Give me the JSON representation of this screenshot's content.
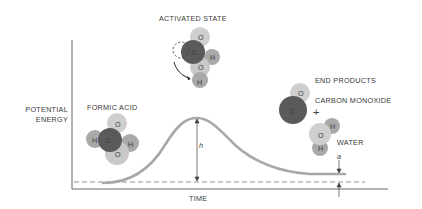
{
  "labels": {
    "activated_state": "ACTIVATED STATE",
    "end_products": "END PRODUCTS",
    "carbon_monoxide": "CARBON MONOXIDE",
    "plus": "+",
    "water": "WATER",
    "formic_acid": "FORMIC ACID",
    "y_axis_line1": "POTENTIAL",
    "y_axis_line2": "ENERGY",
    "x_axis": "TIME",
    "activation_height": "h",
    "energy_difference": "a"
  },
  "atoms": {
    "carbon": "C",
    "oxygen": "O",
    "hydrogen": "H"
  },
  "colors": {
    "curve": "#a8a8a8",
    "carbon": "#5a5a5a",
    "oxygen": "#c8c8c8",
    "hydrogen": "#a9a9a9",
    "axis": "#555555"
  }
}
